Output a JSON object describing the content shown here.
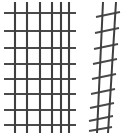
{
  "canvas": {
    "width": 127,
    "height": 134,
    "background_color": "#ffffff",
    "title": "wire-mesh-panels"
  },
  "palette": {
    "wire_dark": "#3a3a3a",
    "wire_mid": "#555555",
    "wire_light": "#7a7a7a",
    "background": "#ffffff"
  },
  "objects": [
    {
      "id": "left-panel",
      "label": "flat welded wire mesh panel",
      "view": "frontal",
      "bounds": {
        "x": 3,
        "y": 2,
        "width": 73,
        "height": 132
      },
      "vertical_wires": {
        "count": 6,
        "x_positions": [
          15,
          27,
          40,
          52,
          61,
          69
        ],
        "y_top": 2,
        "y_bottom": 133,
        "stroke_width": 2.1,
        "color": "#3f3f3f"
      },
      "horizontal_wires": {
        "count": 8,
        "y_positions": [
          13,
          31,
          48,
          64,
          79,
          94,
          110,
          125
        ],
        "x_left": 4,
        "x_right": 76,
        "stroke_width": 2.0,
        "color": "#4a4a4a"
      }
    },
    {
      "id": "right-panel",
      "label": "narrow welded wire mesh panel in perspective",
      "view": "angled",
      "bounds": {
        "x": 93,
        "y": 2,
        "width": 26,
        "height": 132
      },
      "vertical_wires": {
        "count": 2,
        "stroke_width": 2.0,
        "color": "#3f3f3f",
        "lines": [
          {
            "x_top": 103,
            "y_top": 2,
            "x_bottom": 97,
            "y_bottom": 133
          },
          {
            "x_top": 116,
            "y_top": 2,
            "x_bottom": 108,
            "y_bottom": 133
          }
        ]
      },
      "horizontal_wires": {
        "count": 9,
        "stroke_width": 2.0,
        "color": "#4a4a4a",
        "slant": "down-left to up-right",
        "lines": [
          {
            "x1": 96,
            "y1": 17,
            "x2": 120,
            "y2": 12
          },
          {
            "x1": 95,
            "y1": 33,
            "x2": 119,
            "y2": 28
          },
          {
            "x1": 94,
            "y1": 49,
            "x2": 118,
            "y2": 44
          },
          {
            "x1": 93,
            "y1": 64,
            "x2": 117,
            "y2": 59
          },
          {
            "x1": 92,
            "y1": 79,
            "x2": 116,
            "y2": 74
          },
          {
            "x1": 91,
            "y1": 94,
            "x2": 115,
            "y2": 89
          },
          {
            "x1": 90,
            "y1": 108,
            "x2": 114,
            "y2": 103
          },
          {
            "x1": 89,
            "y1": 121,
            "x2": 113,
            "y2": 116
          },
          {
            "x1": 89,
            "y1": 131,
            "x2": 112,
            "y2": 127
          }
        ]
      }
    }
  ]
}
